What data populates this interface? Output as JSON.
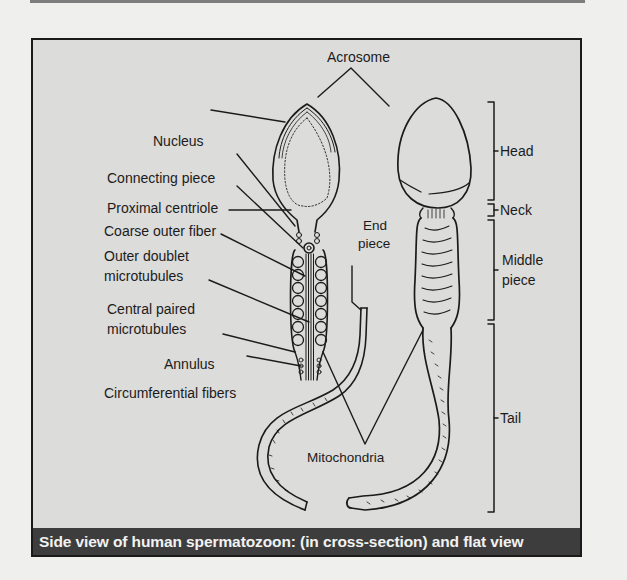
{
  "figure": {
    "title": "Acrosome",
    "caption": "Side view of human spermatozoon: (in cross-section) and flat view",
    "colors": {
      "figure_background": "#dcdcda",
      "caption_background": "#3d3d3d",
      "caption_text": "#f2f2f2",
      "line": "#1b1b1b",
      "page_background": "#efefed"
    },
    "left_labels": [
      {
        "id": "nucleus",
        "text": "Nucleus"
      },
      {
        "id": "connecting-piece",
        "text": "Connecting piece"
      },
      {
        "id": "proximal-centriole",
        "text": "Proximal centriole"
      },
      {
        "id": "coarse-outer-fiber",
        "text": "Coarse outer fiber"
      },
      {
        "id": "outer-doublet-1",
        "text": "Outer doublet"
      },
      {
        "id": "outer-doublet-2",
        "text": "microtubules"
      },
      {
        "id": "central-paired-1",
        "text": "Central paired"
      },
      {
        "id": "central-paired-2",
        "text": "microtubules"
      },
      {
        "id": "annulus",
        "text": "Annulus"
      },
      {
        "id": "circumferential-fibers",
        "text": "Circumferential fibers"
      }
    ],
    "center_labels": {
      "end_piece_1": "End",
      "end_piece_2": "piece",
      "mitochondria": "Mitochondria"
    },
    "region_brackets": [
      {
        "id": "head",
        "text": "Head"
      },
      {
        "id": "neck",
        "text": "Neck"
      },
      {
        "id": "middle-piece-1",
        "text": "Middle"
      },
      {
        "id": "middle-piece-2",
        "text": "piece"
      },
      {
        "id": "tail",
        "text": "Tail"
      }
    ]
  }
}
